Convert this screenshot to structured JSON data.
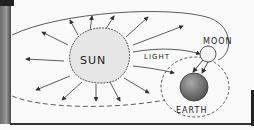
{
  "diagram": {
    "labels": {
      "sun": "SUN",
      "light": "LIGHT",
      "moon": "MOON",
      "earth": "EARTH"
    },
    "colors": {
      "sun_fill": "#e6e6e6",
      "moon_fill": "#f4f4f4",
      "earth_fill": "#7a7a7a",
      "ink": "#333333"
    }
  }
}
